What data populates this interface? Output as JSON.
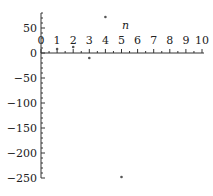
{
  "chart_data": {
    "type": "scatter",
    "title": "",
    "xlabel": "n",
    "ylabel": "",
    "xlim": [
      0,
      10
    ],
    "ylim": [
      -250,
      80
    ],
    "x_ticks": [
      0,
      1,
      2,
      3,
      4,
      5,
      6,
      7,
      8,
      9,
      10
    ],
    "y_ticks": [
      50,
      0,
      -50,
      -100,
      -150,
      -200,
      -250
    ],
    "grid": false,
    "legend": null,
    "series": [
      {
        "name": "points",
        "x": [
          1,
          2,
          3,
          4,
          5
        ],
        "y": [
          8,
          12,
          -10,
          72,
          -248
        ]
      }
    ]
  }
}
